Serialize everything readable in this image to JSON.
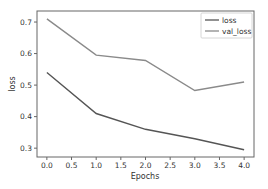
{
  "chart_data": {
    "type": "line",
    "title": "",
    "xlabel": "Epochs",
    "ylabel": "loss",
    "x": [
      0,
      1,
      2,
      3,
      4
    ],
    "series": [
      {
        "name": "loss",
        "values": [
          0.54,
          0.41,
          0.36,
          0.33,
          0.295
        ],
        "color": "#555555"
      },
      {
        "name": "val_loss",
        "values": [
          0.71,
          0.595,
          0.578,
          0.483,
          0.51
        ],
        "color": "#8a8a8a"
      }
    ],
    "xticks": [
      "0.0",
      "0.5",
      "1.0",
      "1.5",
      "2.0",
      "2.5",
      "3.0",
      "3.5",
      "4.0"
    ],
    "yticks": [
      "0.3",
      "0.4",
      "0.5",
      "0.6",
      "0.7"
    ],
    "xlim": [
      -0.2,
      4.2
    ],
    "ylim": [
      0.272,
      0.735
    ],
    "grid": false,
    "legend_position": "upper right"
  }
}
